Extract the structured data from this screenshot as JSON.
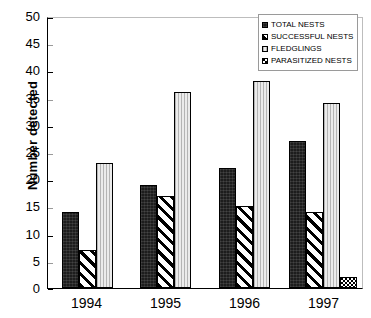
{
  "chart_data": {
    "type": "bar",
    "title": "",
    "xlabel": "",
    "ylabel": "Number detected",
    "categories": [
      "1994",
      "1995",
      "1996",
      "1997"
    ],
    "ylim": [
      0,
      50
    ],
    "ytick_step": 5,
    "yticks": [
      "50",
      "45",
      "40",
      "35",
      "30",
      "25",
      "20",
      "15",
      "10",
      "5",
      "0"
    ],
    "grid": false,
    "legend_position": "top-right",
    "series": [
      {
        "name": "TOTAL NESTS",
        "pattern": "solid-dark",
        "color": "#1d1d1d",
        "values": [
          14,
          19,
          22,
          27
        ]
      },
      {
        "name": "SUCCESSFUL NESTS",
        "pattern": "diagonal-hatch",
        "color": "#000000",
        "values": [
          7,
          17,
          15,
          14
        ]
      },
      {
        "name": "FLEDGLINGS",
        "pattern": "vertical-lines-light",
        "color": "#dcdcdc",
        "values": [
          23,
          36,
          38,
          34
        ]
      },
      {
        "name": "PARASITIZED NESTS",
        "pattern": "dotted",
        "color": "#ffffff",
        "values": [
          0,
          0,
          0,
          2
        ]
      }
    ]
  }
}
